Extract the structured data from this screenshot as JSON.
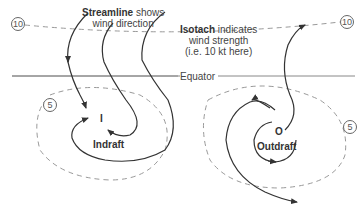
{
  "diagram": {
    "streamline_label": {
      "bold": "Streamline",
      "rest_line1": " shows",
      "line2": "wind direction"
    },
    "isotach_label": {
      "bold": "Isotach",
      "rest_line1": " indicates",
      "line2": "wind strength",
      "line3": "(i.e. 10 kt here)"
    },
    "equator_label": "Equator",
    "isotach_values": {
      "top_left": "10",
      "top_right": "10",
      "left_circle": "5",
      "right_circle": "5"
    },
    "indraft": {
      "center": "I",
      "label": "Indraft"
    },
    "outdraft": {
      "center": "O",
      "label": "Outdraft"
    },
    "colors": {
      "streamline": "#333333",
      "isotach": "#999999",
      "equator": "#888888"
    }
  }
}
